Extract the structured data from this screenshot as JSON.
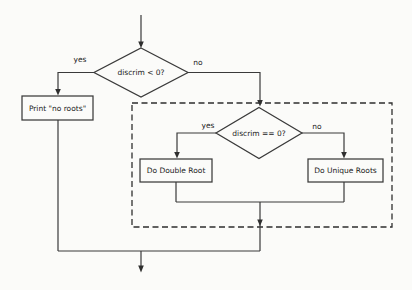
{
  "flowchart": {
    "decision1": {
      "label": "discrim < 0?",
      "yes_label": "yes",
      "no_label": "no"
    },
    "print_no_roots": {
      "label": "Print \"no roots\""
    },
    "decision2": {
      "label": "discrim == 0?",
      "yes_label": "yes",
      "no_label": "no"
    },
    "do_double_root": {
      "label": "Do Double Root"
    },
    "do_unique_roots": {
      "label": "Do Unique Roots"
    },
    "colors": {
      "line": "#3a3a3a",
      "text": "#222222",
      "background": "#fbfbf9"
    }
  }
}
